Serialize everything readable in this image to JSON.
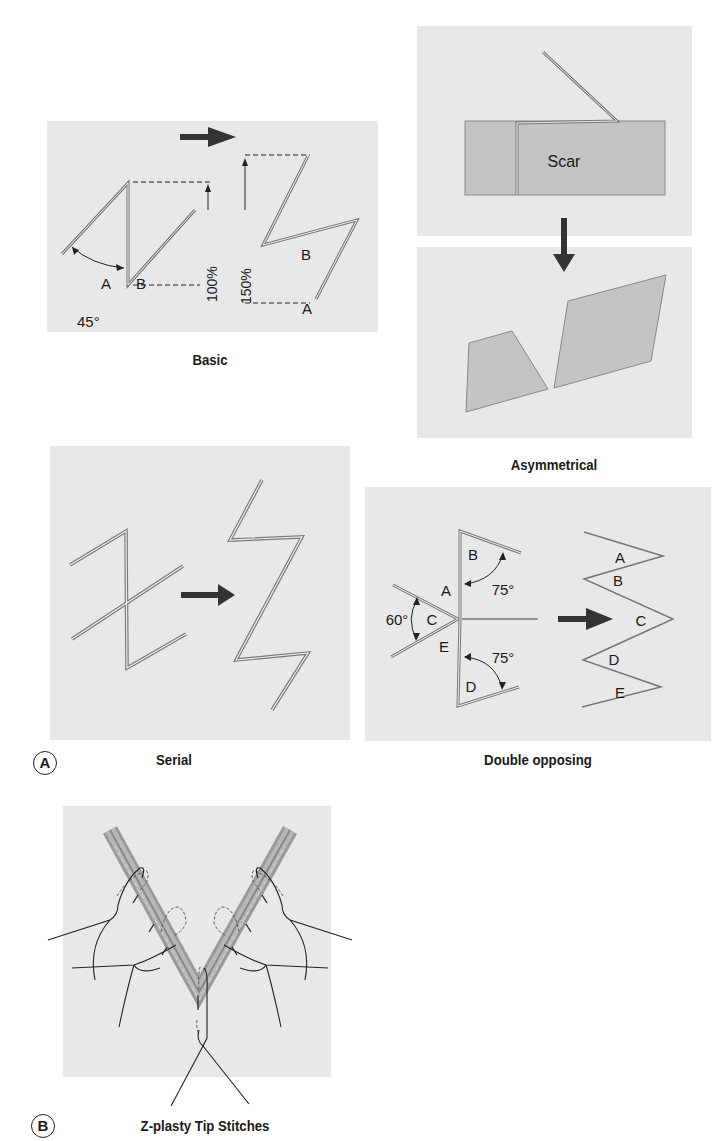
{
  "figure": {
    "panel_labels": {
      "a": "A",
      "b": "B"
    },
    "colors": {
      "panel_bg": "#e8e8e8",
      "flap_fill": "#c4c4c4",
      "line": "#6e6e6e",
      "arrow": "#333333",
      "incision_band": "#a0a0a0"
    }
  },
  "basic": {
    "caption": "Basic",
    "angle_label": "45°",
    "before_labels": {
      "a": "A",
      "b": "B"
    },
    "after_labels": {
      "a": "A",
      "b": "B"
    },
    "length_before": "100%",
    "length_after": "150%"
  },
  "asymmetrical": {
    "caption": "Asymmetrical",
    "scar_label": "Scar"
  },
  "serial": {
    "caption": "Serial"
  },
  "double_opposing": {
    "caption": "Double opposing",
    "before_labels": {
      "a": "A",
      "b": "B",
      "c": "C",
      "d": "D",
      "e": "E"
    },
    "after_labels": {
      "a": "A",
      "b": "B",
      "c": "C",
      "d": "D",
      "e": "E"
    },
    "angle_center": "60°",
    "angle_top": "75°",
    "angle_bottom": "75°"
  },
  "tip_stitches": {
    "caption": "Z-plasty Tip Stitches"
  }
}
